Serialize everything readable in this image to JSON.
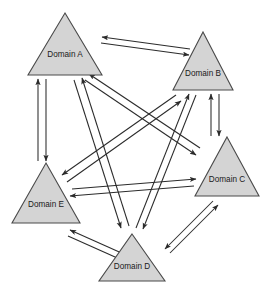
{
  "diagram": {
    "type": "directed-graph",
    "background_color": "#ffffff",
    "node_shape": "triangle",
    "node_fill_color": "#d4d4d4",
    "node_stroke_color": "#4a4a4a",
    "edge_color": "#2b2b2b",
    "label_color": "#1a1a1a",
    "nodes": [
      {
        "id": "A",
        "label": "Domain A",
        "apex_x": 65,
        "apex_y": 13,
        "left_x": 28,
        "right_x": 102,
        "base_y": 75,
        "label_x": 65,
        "label_y": 55
      },
      {
        "id": "B",
        "label": "Domain B",
        "apex_x": 203,
        "apex_y": 32,
        "left_x": 173,
        "right_x": 233,
        "base_y": 90,
        "label_x": 203,
        "label_y": 74
      },
      {
        "id": "C",
        "label": "Domain C",
        "apex_x": 227,
        "apex_y": 137,
        "left_x": 195,
        "right_x": 259,
        "base_y": 196,
        "label_x": 227,
        "label_y": 180
      },
      {
        "id": "D",
        "label": "Domain D",
        "apex_x": 132,
        "apex_y": 234,
        "left_x": 99,
        "right_x": 165,
        "base_y": 281,
        "label_x": 132,
        "label_y": 267
      },
      {
        "id": "E",
        "label": "Domain E",
        "apex_x": 46,
        "apex_y": 163,
        "left_x": 12,
        "right_x": 80,
        "base_y": 223,
        "label_x": 46,
        "label_y": 205
      }
    ],
    "edges": [
      {
        "from": "A",
        "to": "B",
        "bidirectional": true,
        "out": {
          "x1": 101,
          "y1": 43,
          "x2": 189,
          "y2": 55
        },
        "in": {
          "x1": 190,
          "y1": 49,
          "x2": 102,
          "y2": 37
        }
      },
      {
        "from": "A",
        "to": "E",
        "bidirectional": true,
        "out": {
          "x1": 46,
          "y1": 79,
          "x2": 46,
          "y2": 161
        },
        "in": {
          "x1": 38,
          "y1": 161,
          "x2": 38,
          "y2": 79
        }
      },
      {
        "from": "B",
        "to": "C",
        "bidirectional": true,
        "out": {
          "x1": 219,
          "y1": 94,
          "x2": 219,
          "y2": 136
        },
        "in": {
          "x1": 211,
          "y1": 136,
          "x2": 211,
          "y2": 94
        }
      },
      {
        "from": "E",
        "to": "D",
        "bidirectional": true,
        "out": {
          "x1": 68,
          "y1": 236,
          "x2": 124,
          "y2": 261
        },
        "in": {
          "x1": 126,
          "y1": 255,
          "x2": 70,
          "y2": 230
        }
      },
      {
        "from": "D",
        "to": "C",
        "bidirectional": true,
        "out": {
          "x1": 170,
          "y1": 253,
          "x2": 218,
          "y2": 205
        },
        "in": {
          "x1": 213,
          "y1": 201,
          "x2": 165,
          "y2": 249
        }
      },
      {
        "from": "A",
        "to": "C",
        "bidirectional": true,
        "out": {
          "x1": 85,
          "y1": 80,
          "x2": 196,
          "y2": 155
        },
        "in": {
          "x1": 200,
          "y1": 148,
          "x2": 89,
          "y2": 74
        }
      },
      {
        "from": "A",
        "to": "D",
        "bidirectional": true,
        "out": {
          "x1": 74,
          "y1": 80,
          "x2": 121,
          "y2": 228
        },
        "in": {
          "x1": 129,
          "y1": 226,
          "x2": 82,
          "y2": 78
        }
      },
      {
        "from": "B",
        "to": "E",
        "bidirectional": true,
        "out": {
          "x1": 176,
          "y1": 95,
          "x2": 62,
          "y2": 175
        },
        "in": {
          "x1": 67,
          "y1": 182,
          "x2": 181,
          "y2": 101
        }
      },
      {
        "from": "B",
        "to": "D",
        "bidirectional": true,
        "out": {
          "x1": 196,
          "y1": 95,
          "x2": 143,
          "y2": 229
        },
        "in": {
          "x1": 136,
          "y1": 228,
          "x2": 189,
          "y2": 94
        }
      },
      {
        "from": "C",
        "to": "E",
        "bidirectional": true,
        "out": {
          "x1": 194,
          "y1": 186,
          "x2": 70,
          "y2": 196
        },
        "in": {
          "x1": 72,
          "y1": 189,
          "x2": 196,
          "y2": 179
        }
      }
    ]
  }
}
